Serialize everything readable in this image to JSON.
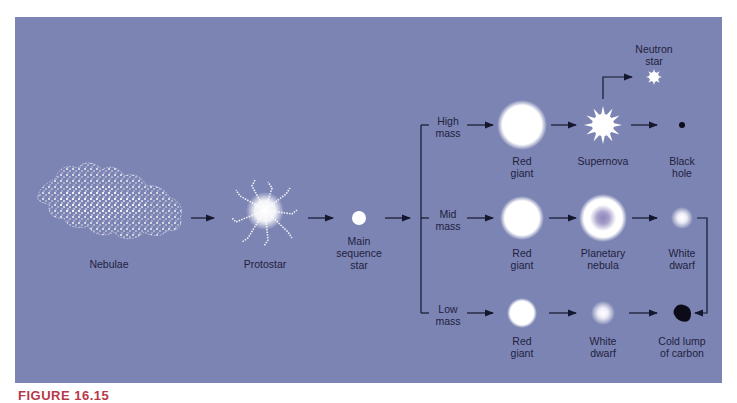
{
  "figure": {
    "caption": "FIGURE 16.15",
    "background_color": "#7c84b3",
    "text_color": "#1f2240",
    "caption_color": "#b8384a"
  },
  "stages": {
    "nebulae": "Nebulae",
    "protostar": "Protostar",
    "main_sequence": [
      "Main",
      "sequence",
      "star"
    ]
  },
  "branches": {
    "high": {
      "label": [
        "High",
        "mass"
      ],
      "red_giant": [
        "Red",
        "giant"
      ],
      "supernova": "Supernova",
      "neutron_star": [
        "Neutron",
        "star"
      ],
      "black_hole": [
        "Black",
        "hole"
      ]
    },
    "mid": {
      "label": [
        "Mid",
        "mass"
      ],
      "red_giant": [
        "Red",
        "giant"
      ],
      "planetary_nebula": [
        "Planetary",
        "nebula"
      ],
      "white_dwarf": [
        "White",
        "dwarf"
      ]
    },
    "low": {
      "label": [
        "Low",
        "mass"
      ],
      "red_giant": [
        "Red",
        "giant"
      ],
      "white_dwarf": [
        "White",
        "dwarf"
      ],
      "cold_lump": [
        "Cold lump",
        "of carbon"
      ]
    }
  }
}
